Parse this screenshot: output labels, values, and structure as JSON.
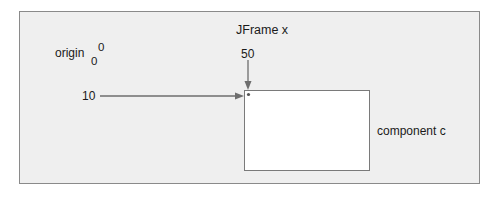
{
  "diagram": {
    "title": "JFrame x",
    "origin_label": "origin",
    "origin_x": "0",
    "origin_y": "0",
    "x_offset_label": "50",
    "y_offset_label": "10",
    "component_label": "component c",
    "colors": {
      "frame_bg": "#efefef",
      "frame_border": "#8a8a8a",
      "component_bg": "#ffffff",
      "component_border": "#7a7a7a",
      "arrow": "#6e6e6e",
      "text": "#1a1a1a"
    },
    "arrows": [
      {
        "name": "y-offset-arrow",
        "from": [
          100,
          96
        ],
        "to": [
          243,
          96
        ],
        "direction": "right"
      },
      {
        "name": "x-offset-arrow",
        "from": [
          248,
          60
        ],
        "to": [
          248,
          89
        ],
        "direction": "down"
      }
    ]
  }
}
